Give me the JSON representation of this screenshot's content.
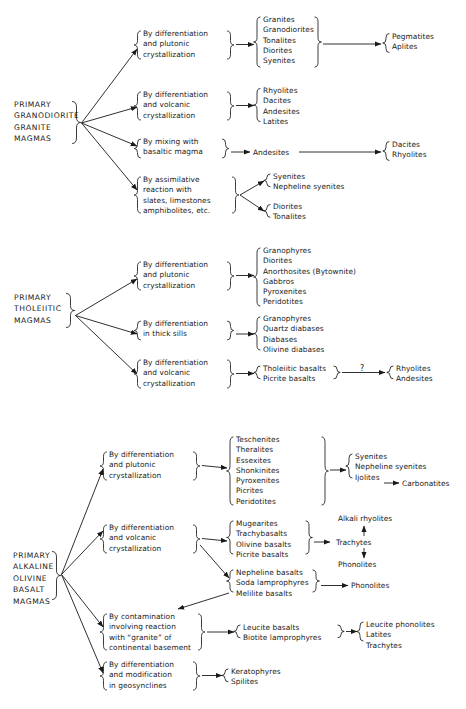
{
  "figure": {
    "groups": [
      {
        "id": "granodiorite",
        "source_label": [
          "PRIMARY",
          "GRANODIORITE",
          "GRANITE",
          "MAGMAS"
        ],
        "branches": [
          {
            "process": [
              "By differentiation",
              "and plutonic",
              "crystallization"
            ],
            "products": [
              "Granites",
              "Granodiorites",
              "Tonalites",
              "Diorites",
              "Syenites"
            ],
            "secondary": [
              "Pegmatites",
              "Aplites"
            ]
          },
          {
            "process": [
              "By differentiation",
              "and volcanic",
              "crystallization"
            ],
            "products": [
              "Rhyolites",
              "Dacites",
              "Andesites",
              "Latites"
            ],
            "secondary": []
          },
          {
            "process": [
              "By mixing with",
              "basaltic magma"
            ],
            "products": [
              "Andesites"
            ],
            "secondary": [
              "Dacites",
              "Rhyolites"
            ]
          },
          {
            "process": [
              "By assimilative",
              "reaction with",
              "slates, limestones",
              "amphibolites, etc."
            ],
            "products_a": [
              "Syenites",
              "Nepheline syenites"
            ],
            "products_b": [
              "Diorites",
              "Tonalites"
            ]
          }
        ]
      },
      {
        "id": "tholeiitic",
        "source_label": [
          "PRIMARY",
          "THOLEIITIC",
          "MAGMAS"
        ],
        "branches": [
          {
            "process": [
              "By differentiation",
              "and plutonic",
              "crystallization"
            ],
            "products": [
              "Granophyres",
              "Diorites",
              "Anorthosites  (Bytownite)",
              "Gabbros",
              "Pyroxenites",
              "Peridotites"
            ],
            "secondary": []
          },
          {
            "process": [
              "By differentiation",
              "in thick sills"
            ],
            "products": [
              "Granophyres",
              "Quartz diabases",
              "Diabases",
              "Olivine diabases"
            ],
            "secondary": []
          },
          {
            "process": [
              "By differentiation",
              "and volcanic",
              "crystallization"
            ],
            "products": [
              "Tholeiitic basalts",
              "Picrite basalts"
            ],
            "link_label": "?",
            "secondary": [
              "Rhyolites",
              "Andesites"
            ]
          }
        ]
      },
      {
        "id": "alkaline",
        "source_label": [
          "PRIMARY",
          "ALKALINE",
          "OLIVINE",
          "BASALT",
          "MAGMAS"
        ],
        "branches": [
          {
            "process": [
              "By differentiation",
              "and plutonic",
              "crystallization"
            ],
            "products": [
              "Teschenites",
              "Theralites",
              "Essexites",
              "Shonkinites",
              "Pyroxenites",
              "Picrites",
              "Peridotites"
            ],
            "secondary": [
              "Syenites",
              "Nepheline syenites",
              "Ijolites"
            ],
            "secondary_tail": "Carbonatites"
          },
          {
            "process": [
              "By differentiation",
              "and volcanic",
              "crystallization"
            ],
            "products": [
              "Mugearites",
              "Trachybasalts",
              "Olivine basalts",
              "Picrite basalts"
            ],
            "secondary_up": "Alkali rhyolites",
            "secondary_mid": "Trachytes",
            "secondary_down": "Phonolites"
          },
          {
            "process": [],
            "products": [
              "Nepheline basalts",
              "Soda lamprophyres",
              "Melilite basalts"
            ],
            "secondary": [
              "Phonolites"
            ]
          },
          {
            "process": [
              "By contamination",
              "involving reaction",
              "with “granite” of",
              "continental basement"
            ],
            "products": [
              "Leucite basalts",
              "Biotite lamprophyres"
            ],
            "secondary": [
              "Leucite phonolites",
              "Latites",
              "Trachytes"
            ]
          },
          {
            "process": [
              "By differentiation",
              "and modification",
              "in geosynclines"
            ],
            "products": [
              "Keratophyres",
              "Spilites"
            ],
            "secondary": []
          }
        ]
      }
    ]
  },
  "colors": {
    "ink": "#1a1a1a",
    "paper": "#ffffff"
  }
}
